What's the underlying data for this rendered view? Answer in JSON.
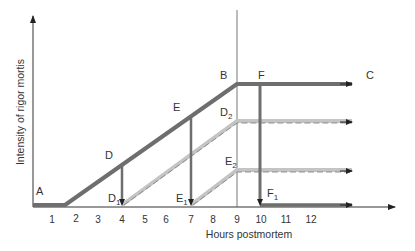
{
  "diagram": {
    "type": "line-schematic",
    "y_axis_label": "Intensity of rigor mortis",
    "x_axis_label": "Hours postmortem",
    "x_ticks": [
      "1",
      "2",
      "3",
      "4",
      "5",
      "6",
      "7",
      "8",
      "9",
      "10",
      "11",
      "12"
    ],
    "points": {
      "A": "A",
      "B": "B",
      "C": "C",
      "D": "D",
      "E": "E",
      "F": "F",
      "D1_main": "D",
      "D1_sub": "1",
      "D2_main": "D",
      "D2_sub": "2",
      "E1_main": "E",
      "E1_sub": "1",
      "E2_main": "E",
      "E2_sub": "2",
      "F1_main": "F",
      "F1_sub": "1"
    },
    "colors": {
      "main_curve": "#6e6e6e",
      "secondary_curve": "#c4c4c4",
      "dashed_overlay": "#7a7a7a",
      "axis": "#333333"
    }
  }
}
